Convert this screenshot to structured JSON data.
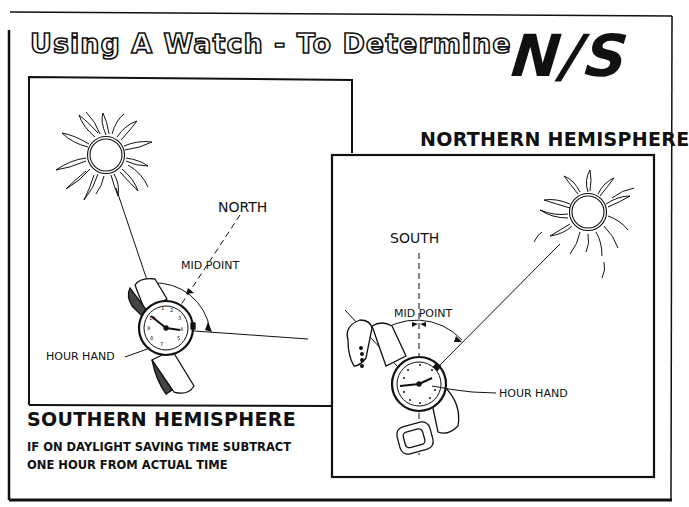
{
  "header": {
    "title": "Using A Watch - To Determine",
    "emphasis": "N/S"
  },
  "southern_panel": {
    "hemisphere_label": "SOUTHERN HEMISPHERE",
    "direction_label": "NORTH",
    "midpoint_label": "MID POINT",
    "hour_hand_label": "HOUR HAND"
  },
  "northern_panel": {
    "hemisphere_label": "NORTHERN HEMISPHERE",
    "direction_label": "SOUTH",
    "midpoint_label": "MID POINT",
    "hour_hand_label": "HOUR HAND"
  },
  "footnote": {
    "line1": "IF ON DAYLIGHT SAVING TIME SUBTRACT",
    "line2": "ONE HOUR FROM ACTUAL TIME"
  },
  "colors": {
    "ink": "#111111",
    "paper": "#ffffff"
  }
}
